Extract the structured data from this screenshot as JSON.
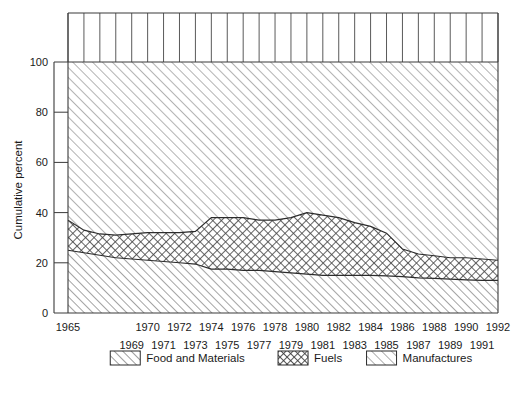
{
  "chart_data": {
    "type": "area",
    "title": "",
    "subtitle": "",
    "xlabel": "",
    "ylabel": "Cumulative percent",
    "ylim": [
      0,
      100
    ],
    "xlim": [
      1965,
      1992
    ],
    "yticks": [
      0,
      20,
      40,
      60,
      80,
      100
    ],
    "ytick_labels": [
      "0",
      "20",
      "40",
      "60",
      "80",
      "100"
    ],
    "grid": "vertical gridlines above 100% only; horizontal ticks on left axis",
    "stacked": true,
    "stack_total": 100,
    "legend_position": "below-axis-centered",
    "x": [
      1965,
      1966,
      1967,
      1968,
      1969,
      1970,
      1971,
      1972,
      1973,
      1974,
      1975,
      1976,
      1977,
      1978,
      1979,
      1980,
      1981,
      1982,
      1983,
      1984,
      1985,
      1986,
      1987,
      1988,
      1989,
      1990,
      1991,
      1992
    ],
    "xtick_labels_top": [
      "1965",
      "1970",
      "1972",
      "1974",
      "1976",
      "1978",
      "1980",
      "1982",
      "1984",
      "1986",
      "1988",
      "1990",
      "1992"
    ],
    "xtick_labels_bottom": [
      "1969",
      "1971",
      "1973",
      "1975",
      "1977",
      "1979",
      "1981",
      "1983",
      "1985",
      "1987",
      "1989",
      "1991"
    ],
    "xtick_top_years": [
      1965,
      1970,
      1972,
      1974,
      1976,
      1978,
      1980,
      1982,
      1984,
      1986,
      1988,
      1990,
      1992
    ],
    "xtick_bottom_years": [
      1969,
      1971,
      1973,
      1975,
      1977,
      1979,
      1981,
      1983,
      1985,
      1987,
      1989,
      1991
    ],
    "series": [
      {
        "name": "Food and Materials",
        "pattern": "forward-diagonal-hatch",
        "values": [
          25,
          24,
          23,
          22,
          21.5,
          21,
          20.5,
          20,
          19.5,
          17.5,
          17.5,
          17,
          17,
          16.5,
          16,
          15.5,
          15,
          15,
          15,
          15,
          14.8,
          14.5,
          14,
          13.8,
          13.5,
          13.2,
          13,
          13
        ]
      },
      {
        "name": "Fuels",
        "pattern": "cross-hatch",
        "values": [
          12,
          9,
          8.5,
          9,
          10,
          11,
          11.5,
          12,
          13,
          20.5,
          20.5,
          21,
          20,
          20.5,
          22,
          24.5,
          24,
          23,
          21,
          19.5,
          17,
          11,
          9.5,
          9,
          8.5,
          8.8,
          8.5,
          8
        ]
      },
      {
        "name": "Manufactures",
        "pattern": "forward-diagonal-hatch-light",
        "values": [
          63,
          67,
          68.5,
          69,
          68.5,
          68,
          68,
          68,
          67.5,
          62,
          62,
          62,
          63,
          63,
          62,
          60,
          61,
          62,
          64,
          65.5,
          68.2,
          74.5,
          76.5,
          77.2,
          78,
          78,
          78.5,
          79
        ]
      }
    ],
    "cumulative_upper_food": [
      25,
      24,
      23,
      22,
      21.5,
      21,
      20.5,
      20,
      19.5,
      17.5,
      17.5,
      17,
      17,
      16.5,
      16,
      15.5,
      15,
      15,
      15,
      15,
      14.8,
      14.5,
      14,
      13.8,
      13.5,
      13.2,
      13,
      13
    ],
    "cumulative_upper_fuels": [
      37,
      33,
      31.5,
      31,
      31.5,
      32,
      32,
      32,
      32.5,
      38,
      38,
      38,
      37,
      37,
      38,
      40,
      39,
      38,
      36,
      34.5,
      31.8,
      25.5,
      23.5,
      22.8,
      22,
      22,
      21.5,
      21
    ]
  },
  "legend": {
    "items": [
      {
        "label": "Food and Materials",
        "pattern": "diagonal"
      },
      {
        "label": "Fuels",
        "pattern": "cross"
      },
      {
        "label": "Manufactures",
        "pattern": "diagonal-light"
      }
    ]
  },
  "axis": {
    "y_title": "Cumulative percent"
  }
}
